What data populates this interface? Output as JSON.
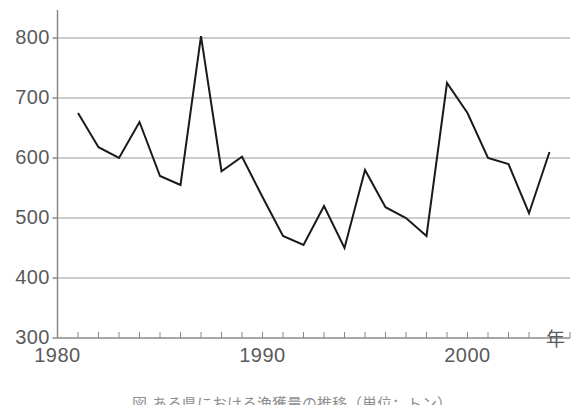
{
  "figure": {
    "caption": "図 ある県における漁獲量の推移（単位：トン）"
  },
  "chart_data": {
    "type": "line",
    "title": "",
    "xlabel": "年",
    "ylabel": "",
    "xlim": [
      1980,
      2005
    ],
    "ylim": [
      300,
      800
    ],
    "grid": true,
    "legend": "none",
    "x_tick_labels": [
      "1980",
      "1990",
      "2000"
    ],
    "x_tick_label_years": [
      1980,
      1990,
      2000
    ],
    "y_tick_labels": [
      "300",
      "400",
      "500",
      "600",
      "700",
      "800"
    ],
    "y_ticks": [
      300,
      400,
      500,
      600,
      700,
      800
    ],
    "x_minor_ticks_every": 1,
    "line_color": "#1a1a1a",
    "grid_color": "#9a9a9a",
    "axis_color": "#8a8a8a",
    "x": [
      1981,
      1982,
      1983,
      1984,
      1985,
      1986,
      1987,
      1988,
      1989,
      1990,
      1991,
      1992,
      1993,
      1994,
      1995,
      1996,
      1997,
      1998,
      1999,
      2000,
      2001,
      2002,
      2003,
      2004
    ],
    "values": [
      675,
      618,
      600,
      660,
      570,
      555,
      803,
      578,
      602,
      535,
      470,
      455,
      520,
      450,
      580,
      518,
      500,
      470,
      725,
      675,
      600,
      590,
      508,
      610
    ]
  }
}
